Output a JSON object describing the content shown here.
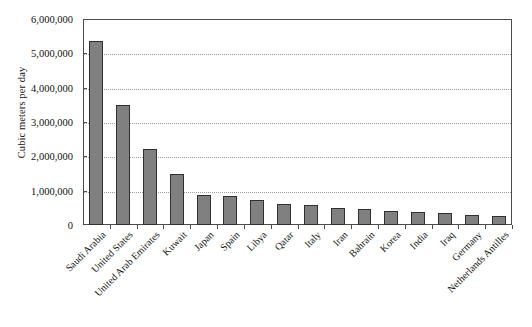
{
  "chart_data": {
    "type": "bar",
    "title": "",
    "xlabel": "",
    "ylabel": "Cubic meters per day",
    "ylim": [
      0,
      6000000
    ],
    "ytick_values": [
      0,
      1000000,
      2000000,
      3000000,
      4000000,
      5000000,
      6000000
    ],
    "ytick_labels": [
      "0",
      "1,000,000",
      "2,000,000",
      "3,000,000",
      "4,000,000",
      "5,000,000",
      "6,000,000"
    ],
    "grid": true,
    "grid_axis": "y",
    "grid_style": "dotted",
    "legend": false,
    "legend_position": "none",
    "bar_color": "#808080",
    "bar_edge_color": "#303030",
    "plot_border_color": "#4d4d4d",
    "background_color": "#ffffff",
    "xtick_rotation": -45,
    "categories": [
      "Saudi Arabia",
      "United States",
      "United Arab Emirates",
      "Kuwait",
      "Japan",
      "Spain",
      "Libya",
      "Qatar",
      "Italy",
      "Iran",
      "Bahrain",
      "Korea",
      "India",
      "Iraq",
      "Germany",
      "Netherlands Antilles"
    ],
    "values": [
      5350000,
      3500000,
      2200000,
      1500000,
      870000,
      850000,
      730000,
      600000,
      580000,
      500000,
      460000,
      420000,
      390000,
      350000,
      280000,
      250000
    ]
  }
}
